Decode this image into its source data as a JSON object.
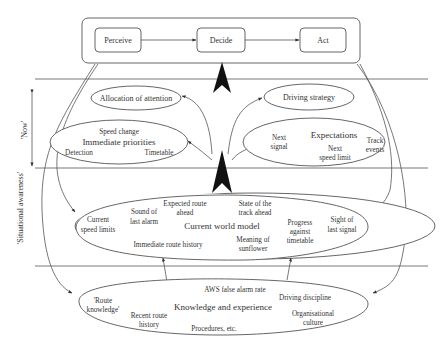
{
  "diagram": {
    "top_box": {
      "steps": [
        "Perceive",
        "Decide",
        "Act"
      ]
    },
    "side_labels": {
      "now": "'Now'",
      "situational_awareness": "'Situational awareness'"
    },
    "band_now": {
      "allocation": "Allocation of attention",
      "strategy": "Driving strategy",
      "priorities": {
        "title": "Immediate priorities",
        "items": [
          "Speed change",
          "Detection",
          "Timetable"
        ]
      },
      "expectations": {
        "title": "Expectations",
        "items": [
          "Next",
          "signal",
          "Next",
          "speed limit",
          "Track",
          "events"
        ]
      }
    },
    "world_model": {
      "title": "Current world model",
      "items": [
        "Current",
        "speed limits",
        "Sound of",
        "last alarm",
        "Expected route",
        "ahead",
        "State of the",
        "track ahead",
        "Progress",
        "against",
        "timetable",
        "Sight of",
        "last signal",
        "Immediate route history",
        "Meaning of",
        "sunflower"
      ]
    },
    "knowledge": {
      "title": "Knowledge and experience",
      "items": [
        "'Route",
        "knowledge'",
        "Recent route",
        "history",
        "AWS false alarm rate",
        "Driving discipline",
        "Organisational",
        "culture",
        "Procedures, etc."
      ]
    }
  }
}
